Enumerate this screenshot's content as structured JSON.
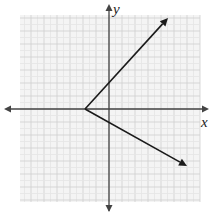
{
  "graph": {
    "x_axis_label": "x",
    "y_axis_label": "y",
    "grid": {
      "left": 20,
      "top": 15,
      "right": 200,
      "bottom": 202,
      "minor_step": 6.5,
      "major_every": 2
    },
    "origin_px": [
      109,
      109
    ],
    "colors": {
      "background": "#ffffff",
      "grid_minor": "#e4e4e4",
      "grid_major": "#cfcfcf",
      "grid_fill": "#f4f4f4",
      "axis": "#444444",
      "line": "#1a1a1a"
    },
    "vertex_px": [
      85,
      109
    ],
    "ray_upper_end_px": [
      168,
      18
    ],
    "ray_lower_end_px": [
      187,
      166
    ]
  }
}
